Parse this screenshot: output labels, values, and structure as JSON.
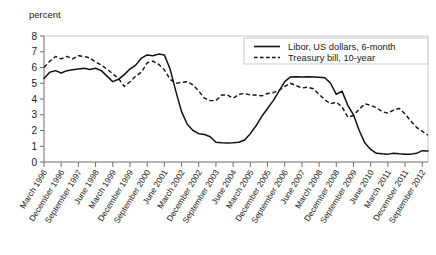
{
  "chart_data": {
    "type": "line",
    "title": "",
    "xlabel": "",
    "ylabel": "percent",
    "ylim": [
      0,
      8
    ],
    "yticks": [
      0,
      1,
      2,
      3,
      4,
      5,
      6,
      7,
      8
    ],
    "grid": false,
    "legend_position": "top-right",
    "x": [
      "March 1996",
      "June 1996",
      "September 1996",
      "December 1996",
      "March 1997",
      "June 1997",
      "September 1997",
      "December 1997",
      "March 1998",
      "June 1998",
      "September 1998",
      "December 1998",
      "March 1999",
      "June 1999",
      "September 1999",
      "December 1999",
      "March 2000",
      "June 2000",
      "September 2000",
      "December 2000",
      "March 2001",
      "June 2001",
      "September 2001",
      "December 2001",
      "March 2002",
      "June 2002",
      "September 2002",
      "December 2002",
      "March 2003",
      "June 2003",
      "September 2003",
      "December 2003",
      "March 2004",
      "June 2004",
      "September 2004",
      "December 2004",
      "March 2005",
      "June 2005",
      "September 2005",
      "December 2005",
      "March 2006",
      "June 2006",
      "September 2006",
      "December 2006",
      "March 2007",
      "June 2007",
      "September 2007",
      "December 2007",
      "March 2008",
      "June 2008",
      "September 2008",
      "December 2008",
      "March 2009",
      "June 2009",
      "September 2009",
      "December 2009",
      "March 2010",
      "June 2010",
      "September 2010",
      "December 2010",
      "March 2011",
      "June 2011",
      "September 2011",
      "December 2011",
      "March 2012",
      "June 2012",
      "September 2012",
      "December 2012"
    ],
    "xtick_labels": [
      "March 1996",
      "December 1996",
      "September 1997",
      "June 1998",
      "March 1999",
      "December 1999",
      "September 2000",
      "June 2001",
      "March 2002",
      "December 2002",
      "September 2003",
      "June 2004",
      "March 2005",
      "December 2005",
      "September 2006",
      "June 2007",
      "March 2008",
      "December 2008",
      "September 2009",
      "June 2010",
      "March 2011",
      "December 2011",
      "September 2012"
    ],
    "xtick_indices": [
      0,
      3,
      6,
      9,
      12,
      15,
      18,
      21,
      24,
      27,
      30,
      33,
      36,
      39,
      42,
      45,
      48,
      51,
      54,
      57,
      60,
      63,
      66
    ],
    "series": [
      {
        "name": "Libor, US dollars, 6-month",
        "style": "solid",
        "color": "#111111",
        "values": [
          5.3,
          5.7,
          5.8,
          5.65,
          5.8,
          5.85,
          5.9,
          5.95,
          5.88,
          5.95,
          5.8,
          5.45,
          5.1,
          5.25,
          5.55,
          5.9,
          6.15,
          6.6,
          6.8,
          6.75,
          6.85,
          6.8,
          5.9,
          4.5,
          3.2,
          2.4,
          2.0,
          1.8,
          1.75,
          1.6,
          1.25,
          1.22,
          1.2,
          1.22,
          1.25,
          1.4,
          1.8,
          2.3,
          2.9,
          3.4,
          3.9,
          4.5,
          5.1,
          5.4,
          5.42,
          5.4,
          5.42,
          5.4,
          5.38,
          5.35,
          5.0,
          4.3,
          4.5,
          3.6,
          3.0,
          2.0,
          1.2,
          0.8,
          0.55,
          0.52,
          0.5,
          0.55,
          0.52,
          0.5,
          0.5,
          0.55,
          0.72,
          0.7
        ]
      },
      {
        "name": "Treasury bill, 10-year",
        "style": "dashed",
        "color": "#111111",
        "values": [
          6.0,
          6.4,
          6.7,
          6.55,
          6.7,
          6.55,
          6.75,
          6.7,
          6.6,
          6.35,
          6.15,
          5.9,
          5.6,
          5.3,
          4.8,
          5.1,
          5.45,
          5.7,
          6.3,
          6.4,
          6.2,
          5.85,
          5.25,
          5.0,
          5.05,
          5.1,
          4.9,
          4.5,
          4.05,
          3.9,
          3.9,
          4.25,
          4.25,
          4.05,
          4.3,
          4.35,
          4.25,
          4.25,
          4.2,
          4.35,
          4.4,
          4.55,
          4.8,
          5.0,
          4.85,
          4.7,
          4.75,
          4.65,
          4.3,
          3.95,
          3.7,
          3.8,
          3.5,
          2.85,
          2.95,
          3.35,
          3.7,
          3.6,
          3.45,
          3.2,
          3.1,
          3.3,
          3.4,
          3.05,
          2.6,
          2.2,
          1.95,
          1.7
        ]
      }
    ],
    "legend": [
      {
        "label": "Libor, US dollars, 6-month",
        "style": "solid"
      },
      {
        "label": "Treasury bill, 10-year",
        "style": "dashed"
      }
    ]
  }
}
